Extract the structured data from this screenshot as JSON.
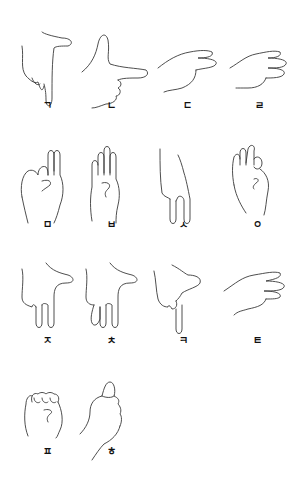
{
  "signs": [
    {
      "letter": "ㄱ",
      "pose": "index-down-thumb-out"
    },
    {
      "letter": "ㄴ",
      "pose": "index-horizontal-thumb-up"
    },
    {
      "letter": "ㄷ",
      "pose": "two-fingers-horizontal"
    },
    {
      "letter": "ㄹ",
      "pose": "three-fingers-horizontal"
    },
    {
      "letter": "ㅁ",
      "pose": "two-fingers-up-bent"
    },
    {
      "letter": "ㅂ",
      "pose": "four-fingers-up"
    },
    {
      "letter": "ㅅ",
      "pose": "two-fingers-down"
    },
    {
      "letter": "ㅇ",
      "pose": "fingers-up-thumb-touch"
    },
    {
      "letter": "ㅈ",
      "pose": "two-fingers-down-thumb-out"
    },
    {
      "letter": "ㅊ",
      "pose": "three-fingers-down-thumb-out"
    },
    {
      "letter": "ㅋ",
      "pose": "index-down-thumb-out-bent"
    },
    {
      "letter": "ㅌ",
      "pose": "three-fingers-horizontal-flat"
    },
    {
      "letter": "ㅍ",
      "pose": "fist"
    },
    {
      "letter": "ㅎ",
      "pose": "thumb-up"
    }
  ]
}
